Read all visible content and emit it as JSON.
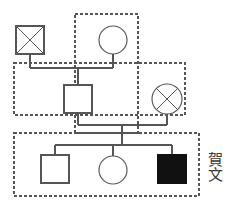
{
  "diagram": {
    "type": "pedigree-chart",
    "title": "",
    "annotation_label": "賀文",
    "colors": {
      "stroke": "#555555",
      "affected_fill": "#111111",
      "unaffected_fill": "#ffffff",
      "dashed_border": "#555555",
      "background": "#ffffff",
      "text": "#3a3a3a"
    },
    "legend_note": "",
    "generations": [
      {
        "id": "gen-1",
        "index": 1,
        "members": [
          {
            "id": "i-1",
            "shape": "square",
            "sex": "male",
            "status": "deceased",
            "affected": false,
            "marker": "cross-out",
            "x": 30,
            "y": 40,
            "size": 28
          },
          {
            "id": "i-2",
            "shape": "circle",
            "sex": "female",
            "status": "living",
            "affected": false,
            "marker": "none",
            "x": 113,
            "y": 40,
            "size": 28
          }
        ]
      },
      {
        "id": "gen-2",
        "index": 2,
        "members": [
          {
            "id": "ii-1",
            "shape": "square",
            "sex": "male",
            "status": "living",
            "affected": false,
            "marker": "none",
            "x": 78,
            "y": 99,
            "size": 28
          },
          {
            "id": "ii-2",
            "shape": "circle",
            "sex": "female",
            "status": "deceased",
            "affected": false,
            "marker": "cross-out",
            "x": 167,
            "y": 99,
            "size": 30
          }
        ]
      },
      {
        "id": "gen-3",
        "index": 3,
        "members": [
          {
            "id": "iii-1",
            "shape": "square",
            "sex": "male",
            "status": "living",
            "affected": false,
            "marker": "none",
            "x": 55,
            "y": 169,
            "size": 28
          },
          {
            "id": "iii-2",
            "shape": "circle",
            "sex": "female",
            "status": "living",
            "affected": false,
            "marker": "none",
            "x": 113,
            "y": 170,
            "size": 28
          },
          {
            "id": "iii-3",
            "shape": "square",
            "sex": "male",
            "status": "living",
            "affected": true,
            "marker": "filled",
            "x": 172,
            "y": 169,
            "size": 28
          }
        ]
      }
    ],
    "unions": [
      {
        "id": "union-1",
        "partners": [
          "i-1",
          "i-2"
        ],
        "marriage_line_y": 68,
        "x_from": 30,
        "x_to": 113,
        "descent_x": 78,
        "children": [
          "ii-1"
        ]
      },
      {
        "id": "union-2",
        "partners": [
          "ii-1",
          "ii-2"
        ],
        "marriage_line_y": 125,
        "x_from": 78,
        "x_to": 167,
        "descent_x": 122,
        "sibship_line_y": 145,
        "children": [
          "iii-1",
          "iii-2",
          "iii-3"
        ]
      }
    ],
    "groupings": [
      {
        "id": "household-1",
        "style": "dashed",
        "x": 75,
        "y": 14,
        "width": 63,
        "height": 119
      },
      {
        "id": "household-2",
        "style": "dashed",
        "x": 14,
        "y": 63,
        "width": 171,
        "height": 52
      },
      {
        "id": "household-3",
        "style": "dashed",
        "x": 14,
        "y": 133,
        "width": 185,
        "height": 63
      }
    ]
  }
}
